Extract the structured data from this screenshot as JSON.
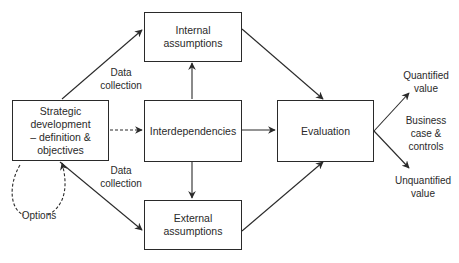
{
  "nodes": {
    "strategic": "Strategic\ndevelopment\n– definition &\nobjectives",
    "internal": "Internal\nassumptions",
    "interdependencies": "Interdependencies",
    "external": "External\nassumptions",
    "evaluation": "Evaluation"
  },
  "labels": {
    "data_collection_top": "Data\ncollection",
    "data_collection_bottom": "Data\ncollection",
    "options": "Options",
    "quantified": "Quantified\nvalue",
    "business_case": "Business\ncase &\ncontrols",
    "unquantified": "Unquantified\nvalue"
  },
  "colors": {
    "stroke": "#2a2a2a",
    "background": "#ffffff"
  }
}
